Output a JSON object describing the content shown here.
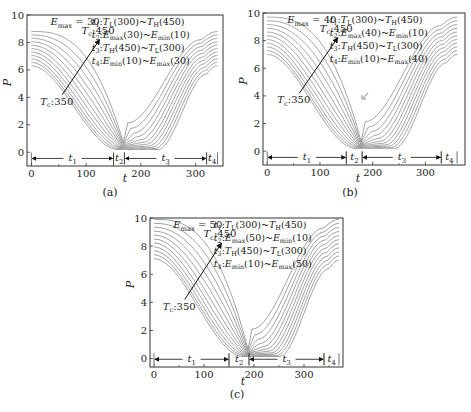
{
  "chart_data": [
    {
      "id": "a",
      "type": "line",
      "caption": "(a)",
      "xlabel": "t",
      "ylabel": "P",
      "xlim": [
        -8,
        350
      ],
      "ylim": [
        -1,
        10
      ],
      "xticks": [
        0,
        100,
        200,
        300
      ],
      "yticks": [
        0,
        2,
        4,
        6,
        8,
        10
      ],
      "grid": false,
      "emax_label": "E_max=30",
      "annotations": [
        "t1: T_L(300) ~ T_H(450)",
        "t2: E_max(30) ~ E_min(10)",
        "t3: T_H(450) ~ T_L(300)",
        "t4: E_min(10) ~ E_max(30)"
      ],
      "arrow": {
        "from_label": "Tc:350",
        "to_label": "Tc:450"
      },
      "phases": [
        {
          "label": "t1",
          "start": 0,
          "end": 150
        },
        {
          "label": "t2",
          "start": 150,
          "end": 170
        },
        {
          "label": "t3",
          "start": 170,
          "end": 320
        },
        {
          "label": "t4",
          "start": 320,
          "end": 340
        }
      ],
      "series_params": {
        "Tc": [
          350,
          360,
          370,
          380,
          390,
          400,
          410,
          420,
          430,
          440,
          450
        ],
        "p_start_low": 6.3,
        "p_start_high": 8.8,
        "t_min": 168,
        "p_min": 0.2,
        "t_end": 340,
        "p_end_low": 6.3,
        "p_end_high": 8.8
      },
      "series": [
        {
          "name": "Tc=350",
          "x": [
            0,
            50,
            100,
            150,
            168,
            200,
            250,
            300,
            320,
            340
          ],
          "values": [
            6.3,
            4.6,
            2.3,
            0.6,
            0.3,
            0.3,
            0.6,
            3.3,
            5.5,
            6.3
          ]
        },
        {
          "name": "Tc=400",
          "x": [
            0,
            50,
            100,
            150,
            168,
            200,
            250,
            300,
            320,
            340
          ],
          "values": [
            7.5,
            6.2,
            4.0,
            1.2,
            0.3,
            0.6,
            3.2,
            6.3,
            7.1,
            7.5
          ]
        },
        {
          "name": "Tc=450",
          "x": [
            0,
            50,
            100,
            150,
            168,
            200,
            250,
            300,
            320,
            340
          ],
          "values": [
            8.8,
            7.6,
            5.8,
            2.2,
            0.3,
            2.0,
            5.2,
            7.8,
            8.4,
            8.8
          ]
        }
      ]
    },
    {
      "id": "b",
      "type": "line",
      "caption": "(b)",
      "xlabel": "t",
      "ylabel": "P",
      "xlim": [
        -8,
        375
      ],
      "ylim": [
        -1,
        10
      ],
      "xticks": [
        0,
        100,
        200,
        300
      ],
      "yticks": [
        0,
        2,
        4,
        6,
        8,
        10
      ],
      "grid": false,
      "emax_label": "E_max=40",
      "annotations": [
        "t1: T_L(300) ~ T_H(450)",
        "t2: E_max(40) ~ E_min(10)",
        "t3: T_H(450) ~ T_L(300)",
        "t4: E_min(10) ~ E_max(40)"
      ],
      "arrow": {
        "from_label": "Tc:350",
        "to_label": "Tc:450"
      },
      "phases": [
        {
          "label": "t1",
          "start": 0,
          "end": 150
        },
        {
          "label": "t2",
          "start": 150,
          "end": 180
        },
        {
          "label": "t3",
          "start": 180,
          "end": 330
        },
        {
          "label": "t4",
          "start": 330,
          "end": 360
        }
      ],
      "series_params": {
        "Tc": [
          350,
          360,
          370,
          380,
          390,
          400,
          410,
          420,
          430,
          440,
          450
        ],
        "p_start_low": 7.0,
        "p_start_high": 9.7,
        "t_min": 178,
        "p_min": 0.2,
        "t_end": 360,
        "p_end_low": 7.0,
        "p_end_high": 9.7
      },
      "series": [
        {
          "name": "Tc=350",
          "x": [
            0,
            50,
            100,
            150,
            178,
            210,
            260,
            310,
            330,
            360
          ],
          "values": [
            7.0,
            5.3,
            2.8,
            0.6,
            0.3,
            0.3,
            0.6,
            3.5,
            6.2,
            7.0
          ]
        },
        {
          "name": "Tc=400",
          "x": [
            0,
            50,
            100,
            150,
            178,
            210,
            260,
            310,
            330,
            360
          ],
          "values": [
            8.3,
            6.9,
            4.6,
            1.6,
            0.4,
            1.0,
            3.6,
            6.9,
            7.8,
            8.3
          ]
        },
        {
          "name": "Tc=450",
          "x": [
            0,
            50,
            100,
            150,
            178,
            210,
            260,
            310,
            330,
            360
          ],
          "values": [
            9.7,
            8.4,
            6.4,
            3.2,
            1.6,
            3.0,
            6.0,
            8.8,
            9.3,
            9.7
          ]
        }
      ]
    },
    {
      "id": "c",
      "type": "line",
      "caption": "(c)",
      "xlabel": "t",
      "ylabel": "P",
      "xlim": [
        -8,
        378
      ],
      "ylim": [
        -0.6,
        10
      ],
      "xticks": [
        0,
        100,
        200,
        300
      ],
      "yticks": [
        0,
        2,
        4,
        6,
        8,
        10
      ],
      "grid": false,
      "emax_label": "E_max=50",
      "annotations": [
        "t1: T_L(300) ~ T_H(450)",
        "t2: E_max(50) ~ E_min(10)",
        "t3: T_H(450) ~ T_L(300)",
        "t4: E_min(10) ~ E_max(50)"
      ],
      "arrow": {
        "from_label": "Tc:350",
        "to_label": "Tc:450"
      },
      "phases": [
        {
          "label": "t1",
          "start": 0,
          "end": 150
        },
        {
          "label": "t2",
          "start": 150,
          "end": 190
        },
        {
          "label": "t3",
          "start": 190,
          "end": 340
        },
        {
          "label": "t4",
          "start": 340,
          "end": 370
        }
      ],
      "series_params": {
        "Tc": [
          350,
          360,
          370,
          380,
          390,
          400,
          410,
          420,
          430,
          440,
          450
        ],
        "p_start_low": 7.1,
        "p_start_high": 9.9,
        "t_min": 188,
        "p_min": 0.15,
        "t_end": 370,
        "p_end_low": 7.0,
        "p_end_high": 9.9
      },
      "series": [
        {
          "name": "Tc=350",
          "x": [
            0,
            50,
            100,
            150,
            188,
            220,
            270,
            320,
            340,
            370
          ],
          "values": [
            7.1,
            5.4,
            3.0,
            0.8,
            0.2,
            0.2,
            0.6,
            3.6,
            6.2,
            7.0
          ]
        },
        {
          "name": "Tc=400",
          "x": [
            0,
            50,
            100,
            150,
            188,
            220,
            270,
            320,
            340,
            370
          ],
          "values": [
            8.5,
            7.0,
            4.8,
            2.0,
            0.3,
            1.2,
            3.9,
            7.2,
            8.0,
            8.5
          ]
        },
        {
          "name": "Tc=450",
          "x": [
            0,
            50,
            100,
            150,
            188,
            220,
            270,
            320,
            340,
            370
          ],
          "values": [
            9.9,
            8.6,
            6.6,
            3.8,
            1.2,
            3.6,
            6.6,
            9.0,
            9.5,
            9.9
          ]
        }
      ]
    }
  ],
  "colors": {
    "curve": "#8a8a8a",
    "axis": "#333333",
    "text": "#222222",
    "marker_arrow": "#b0b0b0"
  },
  "layout": {
    "panels": [
      {
        "id": "a",
        "plot_left": 27,
        "plot_top": 15,
        "plot_right": 223,
        "plot_bottom": 166,
        "caption_x": 110,
        "caption_y": 196,
        "xlabel_x": 125,
        "xlabel_y": 182
      },
      {
        "id": "b",
        "plot_left": 263,
        "plot_top": 13,
        "plot_right": 465,
        "plot_bottom": 165,
        "caption_x": 350,
        "caption_y": 196,
        "xlabel_x": 358,
        "xlabel_y": 182
      },
      {
        "id": "c",
        "plot_left": 150,
        "plot_top": 218,
        "plot_right": 343,
        "plot_bottom": 367,
        "caption_x": 237,
        "caption_y": 398,
        "xlabel_x": 243,
        "xlabel_y": 385
      }
    ]
  }
}
